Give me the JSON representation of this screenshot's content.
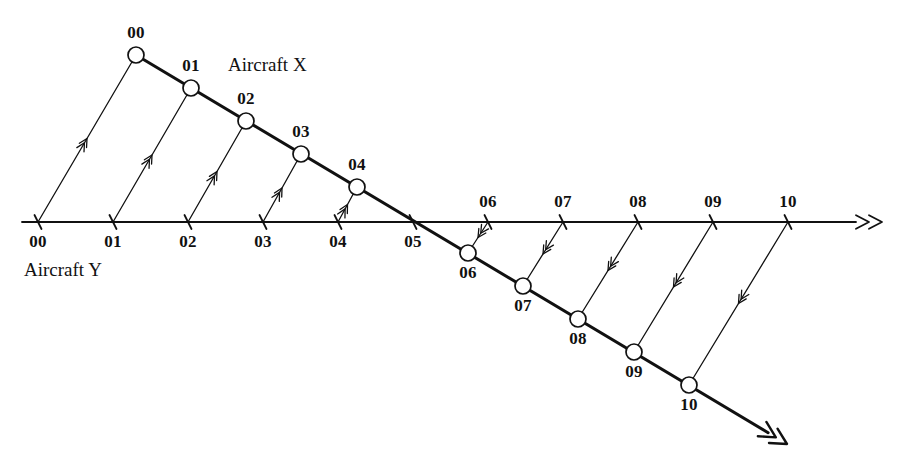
{
  "figure": {
    "title_hidden": "Relative motion plot of two aircraft",
    "background_color": "#ffffff",
    "ink_color": "#111111",
    "width": 898,
    "height": 469
  },
  "labels": {
    "aircraft_x": "Aircraft X",
    "aircraft_y": "Aircraft Y"
  },
  "chart_data": {
    "type": "scatter",
    "title": "",
    "xlabel": "",
    "ylabel": "",
    "grid": false,
    "legend_position": "inline-annotation",
    "annotations": [
      {
        "text": "Aircraft X",
        "x": 228,
        "y": 66
      },
      {
        "text": "Aircraft Y",
        "x": 24,
        "y": 271
      }
    ],
    "series": [
      {
        "name": "Aircraft Y",
        "description": "Horizontal track along the reference axis, time-stamped ticks 00 through 10",
        "marker": "tick",
        "label_side": "below-then-above",
        "axis_y": 222,
        "arrow_end_x": 882,
        "line_start_x": 22,
        "points": [
          {
            "label": "00",
            "x": 38,
            "y": 222,
            "label_pos": "below"
          },
          {
            "label": "01",
            "x": 113,
            "y": 222,
            "label_pos": "below"
          },
          {
            "label": "02",
            "x": 188,
            "y": 222,
            "label_pos": "below"
          },
          {
            "label": "03",
            "x": 263,
            "y": 222,
            "label_pos": "below"
          },
          {
            "label": "04",
            "x": 338,
            "y": 222,
            "label_pos": "below"
          },
          {
            "label": "05",
            "x": 413,
            "y": 222,
            "label_pos": "below"
          },
          {
            "label": "06",
            "x": 488,
            "y": 222,
            "label_pos": "above"
          },
          {
            "label": "07",
            "x": 563,
            "y": 222,
            "label_pos": "above"
          },
          {
            "label": "08",
            "x": 638,
            "y": 222,
            "label_pos": "above"
          },
          {
            "label": "09",
            "x": 713,
            "y": 222,
            "label_pos": "above"
          },
          {
            "label": "10",
            "x": 788,
            "y": 222,
            "label_pos": "above"
          }
        ]
      },
      {
        "name": "Aircraft X",
        "description": "Descending diagonal track, time-stamped circles 00 through 10, crossing the axis between 05 and 06",
        "marker": "circle",
        "marker_radius": 8,
        "line_start": {
          "x": 136,
          "y": 55
        },
        "arrow_end": {
          "x": 787,
          "y": 444
        },
        "points": [
          {
            "label": "00",
            "x": 136,
            "y": 55,
            "label_pos": "above"
          },
          {
            "label": "01",
            "x": 191,
            "y": 88,
            "label_pos": "above"
          },
          {
            "label": "02",
            "x": 246,
            "y": 121,
            "label_pos": "above"
          },
          {
            "label": "03",
            "x": 301,
            "y": 154,
            "label_pos": "above"
          },
          {
            "label": "04",
            "x": 357,
            "y": 187,
            "label_pos": "above"
          },
          {
            "label": "05",
            "x": 412,
            "y": 220,
            "label_pos": "none"
          },
          {
            "label": "06",
            "x": 468,
            "y": 253,
            "label_pos": "below"
          },
          {
            "label": "07",
            "x": 523,
            "y": 286,
            "label_pos": "below"
          },
          {
            "label": "08",
            "x": 578,
            "y": 319,
            "label_pos": "below"
          },
          {
            "label": "09",
            "x": 634,
            "y": 352,
            "label_pos": "below"
          },
          {
            "label": "10",
            "x": 689,
            "y": 385,
            "label_pos": "below"
          }
        ]
      }
    ],
    "sight_lines": [
      {
        "index": "00",
        "from_x": 38,
        "from_y": 222,
        "to_x": 136,
        "to_y": 55
      },
      {
        "index": "01",
        "from_x": 113,
        "from_y": 222,
        "to_x": 191,
        "to_y": 88
      },
      {
        "index": "02",
        "from_x": 188,
        "from_y": 222,
        "to_x": 246,
        "to_y": 121
      },
      {
        "index": "03",
        "from_x": 263,
        "from_y": 222,
        "to_x": 301,
        "to_y": 154
      },
      {
        "index": "04",
        "from_x": 338,
        "from_y": 222,
        "to_x": 357,
        "to_y": 187
      },
      {
        "index": "06",
        "from_x": 488,
        "from_y": 222,
        "to_x": 468,
        "to_y": 253
      },
      {
        "index": "07",
        "from_x": 563,
        "from_y": 222,
        "to_x": 523,
        "to_y": 286
      },
      {
        "index": "08",
        "from_x": 638,
        "from_y": 222,
        "to_x": 578,
        "to_y": 319
      },
      {
        "index": "09",
        "from_x": 713,
        "from_y": 222,
        "to_x": 634,
        "to_y": 352
      },
      {
        "index": "10",
        "from_x": 788,
        "from_y": 222,
        "to_x": 689,
        "to_y": 385
      }
    ]
  }
}
